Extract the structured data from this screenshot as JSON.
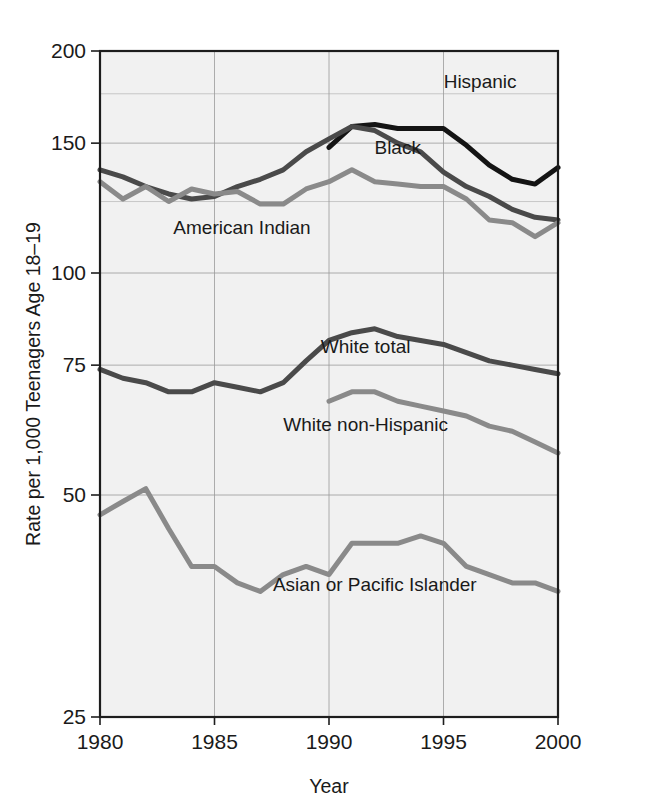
{
  "chart_data": {
    "type": "line",
    "title": "",
    "xlabel": "Year",
    "ylabel": "Rate per 1,000 Teenagers Age 18–19",
    "xlim": [
      1980,
      2000
    ],
    "ylim": [
      25,
      200
    ],
    "yscale": "log",
    "grid": true,
    "legend_position": "inline-labels",
    "x_ticks": [
      "1980",
      "1985",
      "1990",
      "1995",
      "2000"
    ],
    "x_tick_values": [
      1980,
      1985,
      1990,
      1995,
      2000
    ],
    "y_ticks": [
      "25",
      "50",
      "75",
      "100",
      "150",
      "200"
    ],
    "y_tick_values": [
      25,
      50,
      75,
      100,
      150,
      200
    ],
    "y_minor_gridlines": [
      125,
      175
    ],
    "x": [
      1980,
      1981,
      1982,
      1983,
      1984,
      1985,
      1986,
      1987,
      1988,
      1989,
      1990,
      1991,
      1992,
      1993,
      1994,
      1995,
      1996,
      1997,
      1998,
      1999,
      2000
    ],
    "series": [
      {
        "name": "Hispanic",
        "color": "#141414",
        "width": 5.0,
        "label_x": 1996.6,
        "label_y": 178,
        "label_anchor": "middle",
        "x": [
          1990,
          1991,
          1992,
          1993,
          1994,
          1995,
          1996,
          1997,
          1998,
          1999,
          2000
        ],
        "values": [
          148,
          158,
          159,
          157,
          157,
          157,
          149,
          140,
          134,
          132,
          139
        ]
      },
      {
        "name": "Black",
        "color": "#4a4a4a",
        "width": 5.0,
        "label_x": 1993.0,
        "label_y": 145,
        "label_anchor": "middle",
        "x": [
          1980,
          1981,
          1982,
          1983,
          1984,
          1985,
          1986,
          1987,
          1988,
          1989,
          1990,
          1991,
          1992,
          1993,
          1994,
          1995,
          1996,
          1997,
          1998,
          1999,
          2000
        ],
        "values": [
          138,
          135,
          131,
          128,
          126,
          127,
          131,
          134,
          138,
          146,
          152,
          158,
          156,
          150,
          146,
          137,
          131,
          127,
          122,
          119,
          118
        ]
      },
      {
        "name": "American Indian",
        "color": "#8a8a8a",
        "width": 5.0,
        "label_x": 1986.2,
        "label_y": 113,
        "label_anchor": "middle",
        "x": [
          1980,
          1981,
          1982,
          1983,
          1984,
          1985,
          1986,
          1987,
          1988,
          1989,
          1990,
          1991,
          1992,
          1993,
          1994,
          1995,
          1996,
          1997,
          1998,
          1999,
          2000
        ],
        "values": [
          133,
          126,
          131,
          125,
          130,
          128,
          129,
          124,
          124,
          130,
          133,
          138,
          133,
          132,
          131,
          131,
          126,
          118,
          117,
          112,
          117
        ]
      },
      {
        "name": "White total",
        "color": "#4a4a4a",
        "width": 5.0,
        "label_x": 1991.6,
        "label_y": 78,
        "label_anchor": "middle",
        "x": [
          1980,
          1981,
          1982,
          1983,
          1984,
          1985,
          1986,
          1987,
          1988,
          1989,
          1990,
          1991,
          1992,
          1993,
          1994,
          1995,
          1996,
          1997,
          1998,
          1999,
          2000
        ],
        "values": [
          74,
          72,
          71,
          69,
          69,
          71,
          70,
          69,
          71,
          76,
          81,
          83,
          84,
          82,
          81,
          80,
          78,
          76,
          75,
          74,
          73
        ]
      },
      {
        "name": "White non-Hispanic",
        "color": "#8a8a8a",
        "width": 5.0,
        "label_x": 1991.6,
        "label_y": 61,
        "label_anchor": "middle",
        "x": [
          1990,
          1991,
          1992,
          1993,
          1994,
          1995,
          1996,
          1997,
          1998,
          1999,
          2000
        ],
        "values": [
          67,
          69,
          69,
          67,
          66,
          65,
          64,
          62,
          61,
          59,
          57
        ]
      },
      {
        "name": "Asian or Pacific Islander",
        "color": "#8a8a8a",
        "width": 5.0,
        "label_x": 1992.0,
        "label_y": 37,
        "label_anchor": "middle",
        "x": [
          1980,
          1981,
          1982,
          1983,
          1984,
          1985,
          1986,
          1987,
          1988,
          1989,
          1990,
          1991,
          1992,
          1993,
          1994,
          1995,
          1996,
          1997,
          1998,
          1999,
          2000
        ],
        "values": [
          47,
          49,
          51,
          45,
          40,
          40,
          38,
          37,
          39,
          40,
          39,
          43,
          43,
          43,
          44,
          43,
          40,
          39,
          38,
          38,
          37
        ]
      }
    ]
  }
}
